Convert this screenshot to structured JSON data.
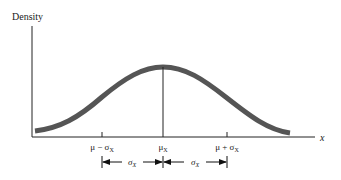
{
  "figure": {
    "y_axis_label": "Density",
    "x_axis_label": "x",
    "tick_labels": {
      "minus_sigma": "μ − σ",
      "minus_sigma_sub": "X",
      "mean": "μ",
      "mean_sub": "X",
      "plus_sigma": "μ + σ",
      "plus_sigma_sub": "X"
    },
    "spans": [
      {
        "label": "σ",
        "sub": "X",
        "from": "μ − σ_X",
        "to": "μ_X"
      },
      {
        "label": "σ",
        "sub": "X",
        "from": "μ_X",
        "to": "μ + σ_X"
      }
    ],
    "curve": "normal density curve",
    "colors": {
      "curve": "#555555",
      "axes": "#222222",
      "text": "#1a1a1a"
    }
  }
}
